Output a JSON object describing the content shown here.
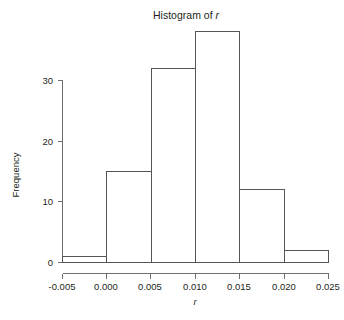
{
  "chart_data": {
    "type": "bar",
    "title": "Histogram of r",
    "title_prefix": "Histogram of ",
    "title_variable": "r",
    "xlabel": "r",
    "ylabel": "Frequency",
    "categories": [
      "-0.005 to 0.000",
      "0.000 to 0.005",
      "0.005 to 0.010",
      "0.010 to 0.015",
      "0.015 to 0.020",
      "0.020 to 0.025"
    ],
    "bin_edges": [
      -0.005,
      0.0,
      0.005,
      0.01,
      0.015,
      0.02,
      0.025
    ],
    "values": [
      1,
      15,
      32,
      38,
      12,
      2
    ],
    "xlim": [
      -0.005,
      0.025
    ],
    "ylim": [
      0,
      38
    ],
    "y_axis_range": [
      0,
      30
    ],
    "xticks": [
      -0.005,
      0.0,
      0.005,
      0.01,
      0.015,
      0.02,
      0.025
    ],
    "xtick_labels": [
      "-0.005",
      "0.000",
      "0.005",
      "0.010",
      "0.015",
      "0.020",
      "0.025"
    ],
    "yticks": [
      0,
      10,
      20,
      30
    ],
    "ytick_labels": [
      "0",
      "10",
      "20",
      "30"
    ],
    "grid": false,
    "legend": false,
    "bar_fill_color": "#ffffff",
    "bar_stroke_color": "#555555",
    "axis_color": "#6f6f6f",
    "text_color": "#231f20"
  },
  "footer": {
    "cropped_text": ""
  }
}
